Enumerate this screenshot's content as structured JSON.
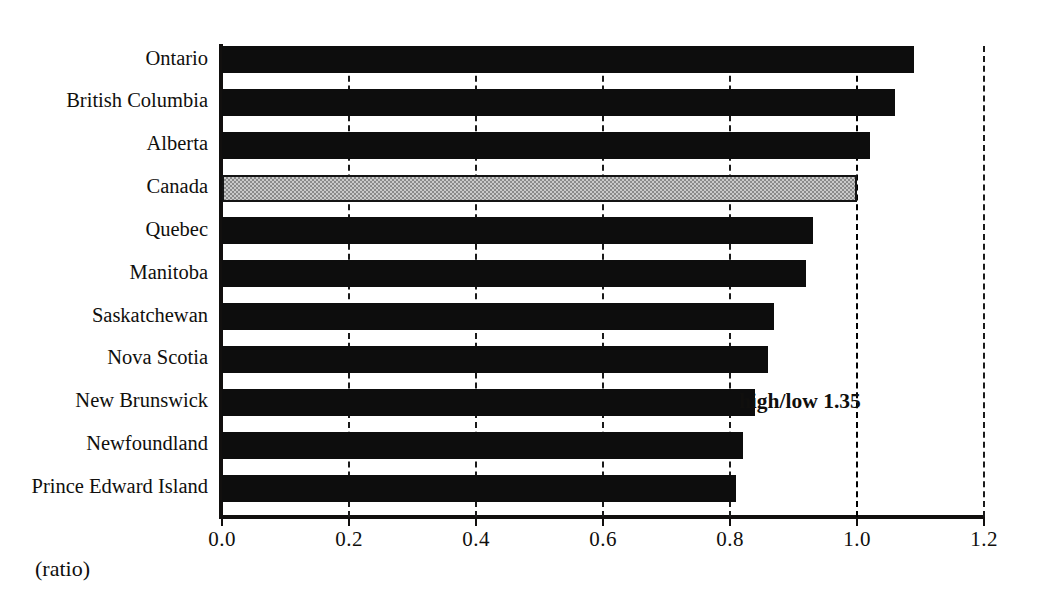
{
  "chart_data": {
    "type": "bar",
    "orientation": "horizontal",
    "title": "",
    "subtitle": "",
    "xlabel": "(ratio)",
    "ylabel": "",
    "xlim": [
      0.0,
      1.2
    ],
    "xticks": [
      "0.0",
      "0.2",
      "0.4",
      "0.6",
      "0.8",
      "1.0",
      "1.2"
    ],
    "xtick_values": [
      0.0,
      0.2,
      0.4,
      0.6,
      0.8,
      1.0,
      1.2
    ],
    "grid": "vertical dashed gridlines at each major tick",
    "legend": "none",
    "categories": [
      "Ontario",
      "British Columbia",
      "Alberta",
      "Canada",
      "Quebec",
      "Manitoba",
      "Saskatchewan",
      "Nova Scotia",
      "New Brunswick",
      "Newfoundland",
      "Prince Edward Island"
    ],
    "values": [
      1.09,
      1.06,
      1.02,
      1.0,
      0.93,
      0.92,
      0.87,
      0.86,
      0.84,
      0.82,
      0.81
    ],
    "highlight_category": "Canada",
    "highlight_index": 3,
    "series": [
      {
        "name": "ratio",
        "values": [
          1.09,
          1.06,
          1.02,
          1.0,
          0.93,
          0.92,
          0.87,
          0.86,
          0.84,
          0.82,
          0.81
        ]
      }
    ],
    "annotations": [
      {
        "text": "high/low 1.35",
        "x": 0.91,
        "category_index": 8
      }
    ],
    "colors": {
      "bar": "#0d0d0d",
      "highlight_bar": "#c9c9c9",
      "highlight_border": "#141414",
      "axis": "#110f0e",
      "grid": "#1a1a1a",
      "text": "#100f0d",
      "background": "#ffffff"
    }
  }
}
